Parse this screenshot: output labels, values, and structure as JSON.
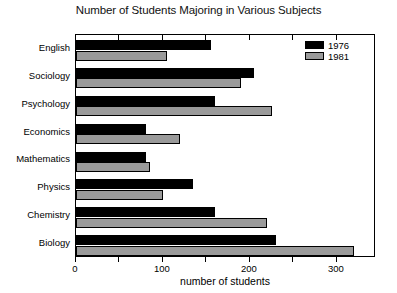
{
  "chart_data": {
    "type": "bar",
    "orientation": "horizontal",
    "title": "Number of Students Majoring in Various Subjects",
    "xlabel": "number of students",
    "ylabel": "",
    "categories": [
      "English",
      "Sociology",
      "Psychology",
      "Economics",
      "Mathematics",
      "Physics",
      "Chemistry",
      "Biology"
    ],
    "series": [
      {
        "name": "1976",
        "color": "#000000",
        "values": [
          155,
          205,
          160,
          80,
          80,
          135,
          160,
          230
        ]
      },
      {
        "name": "1981",
        "color": "#9a9a9a",
        "values": [
          105,
          190,
          225,
          120,
          85,
          100,
          220,
          320
        ]
      }
    ],
    "xlim": [
      0,
      345
    ],
    "xticks": [
      0,
      50,
      100,
      150,
      200,
      250,
      300
    ],
    "xtick_labels": [
      "0",
      "",
      "100",
      "",
      "200",
      "",
      "300"
    ],
    "grid": false,
    "legend_position": "top-right",
    "legend_entries": [
      "1976",
      "1981"
    ]
  }
}
